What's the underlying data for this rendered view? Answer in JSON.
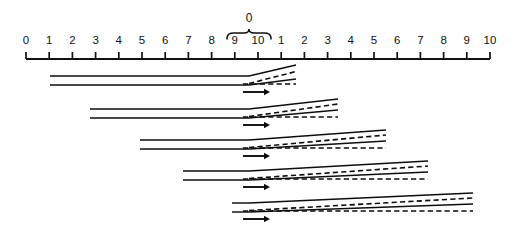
{
  "figure": {
    "background": "#ffffff",
    "ink_color": "#0d0d0d"
  },
  "axis": {
    "name": "horizontal-scale-ruler",
    "x_start": 26,
    "x_end": 490,
    "y": 59,
    "tick_height": 7,
    "tick_count": 21,
    "tick_labels": [
      "0",
      "1",
      "2",
      "3",
      "4",
      "5",
      "6",
      "7",
      "8",
      "9",
      "10",
      "1",
      "2",
      "3",
      "4",
      "5",
      "6",
      "7",
      "8",
      "9",
      "10"
    ],
    "label_y": 44
  },
  "brace": {
    "label": "0",
    "label_x": 249,
    "label_y": 22,
    "span_start_x": 227,
    "span_end_x": 271,
    "y": 33,
    "depth": 6
  },
  "bands": [
    {
      "id": "band-1",
      "start_x": 50,
      "branch_x": 249,
      "end_x": 296,
      "upper_y": 76,
      "lower_y": 85,
      "upper_end_y": 65,
      "lower_end_y": 79,
      "dashed_end_y": 84,
      "arrow_x": 243,
      "arrow_len": 27,
      "arrow_y": 92
    },
    {
      "id": "band-2",
      "start_x": 90,
      "branch_x": 249,
      "end_x": 338,
      "upper_y": 109,
      "lower_y": 118,
      "upper_end_y": 99,
      "lower_end_y": 110,
      "dashed_end_y": 117,
      "arrow_x": 243,
      "arrow_len": 27,
      "arrow_y": 125
    },
    {
      "id": "band-3",
      "start_x": 140,
      "branch_x": 249,
      "end_x": 386,
      "upper_y": 140,
      "lower_y": 149,
      "upper_end_y": 130,
      "lower_end_y": 141,
      "dashed_end_y": 148,
      "arrow_x": 243,
      "arrow_len": 27,
      "arrow_y": 156
    },
    {
      "id": "band-4",
      "start_x": 183,
      "branch_x": 249,
      "end_x": 428,
      "upper_y": 171,
      "lower_y": 180,
      "upper_end_y": 161,
      "lower_end_y": 172,
      "dashed_end_y": 179,
      "arrow_x": 243,
      "arrow_len": 27,
      "arrow_y": 187
    },
    {
      "id": "band-5",
      "start_x": 232,
      "branch_x": 249,
      "end_x": 473,
      "upper_y": 203,
      "lower_y": 212,
      "upper_end_y": 193,
      "lower_end_y": 204,
      "dashed_end_y": 211,
      "arrow_x": 243,
      "arrow_len": 27,
      "arrow_y": 219
    }
  ]
}
